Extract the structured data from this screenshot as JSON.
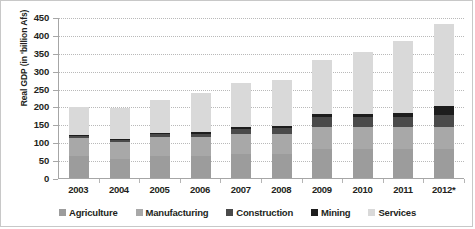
{
  "chart_data": {
    "type": "bar",
    "stacked": true,
    "title": "",
    "xlabel": "",
    "ylabel": "Real GDP (in 'billion Afs)",
    "ylim": [
      0,
      450
    ],
    "ytick_step": 50,
    "yticks": [
      "450",
      "400",
      "350",
      "300",
      "250",
      "200",
      "150",
      "100",
      "50",
      "0"
    ],
    "grid": true,
    "legend_position": "bottom",
    "categories": [
      "2003",
      "2004",
      "2005",
      "2006",
      "2007",
      "2008",
      "2009",
      "2010",
      "2011",
      "2012*"
    ],
    "series": [
      {
        "name": "Agriculture",
        "color": "#9c9c9c",
        "values": [
          62,
          52,
          62,
          62,
          66,
          66,
          80,
          80,
          80,
          80
        ]
      },
      {
        "name": "Manufacturing",
        "color": "#a8a8a8",
        "values": [
          50,
          50,
          52,
          52,
          58,
          58,
          62,
          62,
          62,
          62
        ]
      },
      {
        "name": "Construction",
        "color": "#4a4a4a",
        "values": [
          5,
          4,
          9,
          10,
          14,
          16,
          28,
          28,
          30,
          35
        ]
      },
      {
        "name": "Mining",
        "color": "#1d1d1d",
        "values": [
          3,
          3,
          4,
          4,
          5,
          5,
          8,
          8,
          9,
          23
        ]
      },
      {
        "name": "Services",
        "color": "#d9d9d9",
        "values": [
          78,
          88,
          91,
          109,
          124,
          130,
          152,
          175,
          203,
          230
        ]
      }
    ],
    "totals": [
      198,
      197,
      218,
      237,
      267,
      275,
      330,
      353,
      384,
      430
    ]
  },
  "legend": {
    "items": [
      {
        "label": "Agriculture"
      },
      {
        "label": "Manufacturing"
      },
      {
        "label": "Construction"
      },
      {
        "label": "Mining"
      },
      {
        "label": "Services"
      }
    ]
  }
}
